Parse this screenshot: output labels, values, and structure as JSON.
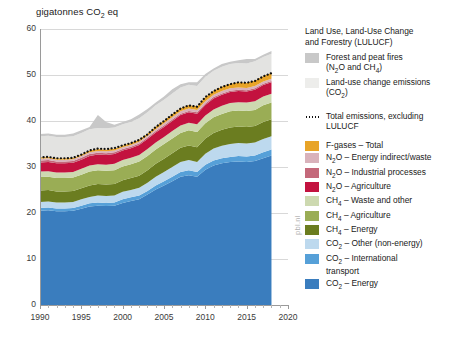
{
  "chart_data": {
    "type": "area",
    "title": "gigatonnes CO2 eq",
    "xlabel": "",
    "ylabel": "gigatonnes CO2 eq",
    "xlim": [
      1990,
      2020
    ],
    "ylim": [
      0,
      60
    ],
    "yticks": [
      0,
      10,
      20,
      30,
      40,
      50,
      60
    ],
    "xticks": [
      1990,
      1995,
      2000,
      2005,
      2010,
      2015,
      2020
    ],
    "grid": true,
    "legend_position": "right",
    "stacked": true,
    "x": [
      1990,
      1991,
      1992,
      1993,
      1994,
      1995,
      1996,
      1997,
      1998,
      1999,
      2000,
      2001,
      2002,
      2003,
      2004,
      2005,
      2006,
      2007,
      2008,
      2009,
      2010,
      2011,
      2012,
      2013,
      2014,
      2015,
      2016,
      2017,
      2018
    ],
    "series": [
      {
        "name": "CO2 - Energy",
        "color": "#3a7dbe",
        "values": [
          20.5,
          20.6,
          20.4,
          20.4,
          20.5,
          20.9,
          21.4,
          21.6,
          21.5,
          21.6,
          22.2,
          22.6,
          23.0,
          24.0,
          25.1,
          26.0,
          26.9,
          27.9,
          28.2,
          27.9,
          29.4,
          30.3,
          30.8,
          31.1,
          31.2,
          31.1,
          31.3,
          31.9,
          32.5
        ]
      },
      {
        "name": "CO2 - International transport",
        "color": "#56a0d8",
        "values": [
          0.6,
          0.6,
          0.6,
          0.6,
          0.6,
          0.7,
          0.7,
          0.7,
          0.7,
          0.7,
          0.8,
          0.8,
          0.8,
          0.8,
          0.9,
          0.9,
          1.0,
          1.0,
          1.1,
          1.0,
          1.1,
          1.1,
          1.1,
          1.1,
          1.2,
          1.2,
          1.2,
          1.3,
          1.3
        ]
      },
      {
        "name": "CO2 - Other (non-energy)",
        "color": "#bdd9ee",
        "values": [
          1.3,
          1.3,
          1.3,
          1.3,
          1.3,
          1.4,
          1.4,
          1.5,
          1.5,
          1.5,
          1.6,
          1.6,
          1.7,
          1.8,
          1.9,
          2.0,
          2.1,
          2.2,
          2.2,
          2.2,
          2.4,
          2.6,
          2.7,
          2.8,
          2.8,
          2.8,
          2.8,
          2.9,
          2.9
        ]
      },
      {
        "name": "CH4 - Energy",
        "color": "#6b7d20",
        "values": [
          2.5,
          2.5,
          2.4,
          2.4,
          2.4,
          2.4,
          2.5,
          2.5,
          2.5,
          2.5,
          2.5,
          2.6,
          2.6,
          2.7,
          2.8,
          2.9,
          3.0,
          3.1,
          3.2,
          3.2,
          3.3,
          3.4,
          3.5,
          3.6,
          3.6,
          3.6,
          3.6,
          3.7,
          3.7
        ]
      },
      {
        "name": "CH4 - Agriculture",
        "color": "#9aad55",
        "values": [
          2.9,
          2.9,
          2.9,
          2.9,
          2.9,
          2.9,
          3.0,
          3.0,
          3.0,
          3.0,
          3.0,
          3.0,
          3.1,
          3.1,
          3.1,
          3.2,
          3.2,
          3.2,
          3.3,
          3.3,
          3.3,
          3.4,
          3.4,
          3.5,
          3.5,
          3.5,
          3.5,
          3.6,
          3.6
        ]
      },
      {
        "name": "CH4 - Waste and other",
        "color": "#cdd9b0",
        "values": [
          1.2,
          1.2,
          1.2,
          1.2,
          1.2,
          1.3,
          1.3,
          1.3,
          1.3,
          1.4,
          1.4,
          1.4,
          1.4,
          1.5,
          1.5,
          1.5,
          1.6,
          1.6,
          1.6,
          1.7,
          1.7,
          1.7,
          1.8,
          1.8,
          1.8,
          1.8,
          1.9,
          1.9,
          1.9
        ]
      },
      {
        "name": "N2O - Agriculture",
        "color": "#c3123f",
        "values": [
          2.0,
          2.0,
          2.0,
          2.0,
          2.0,
          2.0,
          2.1,
          2.1,
          2.1,
          2.1,
          2.1,
          2.1,
          2.2,
          2.2,
          2.2,
          2.2,
          2.2,
          2.3,
          2.3,
          2.3,
          2.3,
          2.4,
          2.4,
          2.4,
          2.4,
          2.4,
          2.5,
          2.5,
          2.5
        ]
      },
      {
        "name": "N2O - Industrial processes",
        "color": "#c4687a",
        "values": [
          0.4,
          0.4,
          0.4,
          0.4,
          0.4,
          0.4,
          0.4,
          0.4,
          0.4,
          0.4,
          0.3,
          0.3,
          0.3,
          0.3,
          0.3,
          0.3,
          0.3,
          0.3,
          0.3,
          0.3,
          0.3,
          0.3,
          0.3,
          0.3,
          0.3,
          0.3,
          0.3,
          0.3,
          0.3
        ]
      },
      {
        "name": "N2O - Energy indirect/waste",
        "color": "#d9b2bb",
        "values": [
          0.4,
          0.4,
          0.4,
          0.4,
          0.4,
          0.4,
          0.4,
          0.4,
          0.4,
          0.4,
          0.4,
          0.4,
          0.4,
          0.4,
          0.4,
          0.5,
          0.5,
          0.5,
          0.5,
          0.5,
          0.5,
          0.5,
          0.5,
          0.5,
          0.5,
          0.5,
          0.5,
          0.5,
          0.5
        ]
      },
      {
        "name": "F-gases - Total",
        "color": "#e8a428",
        "values": [
          0.3,
          0.3,
          0.3,
          0.3,
          0.3,
          0.3,
          0.4,
          0.4,
          0.4,
          0.4,
          0.4,
          0.4,
          0.5,
          0.5,
          0.6,
          0.6,
          0.7,
          0.7,
          0.8,
          0.8,
          0.9,
          0.9,
          1.0,
          1.0,
          1.1,
          1.1,
          1.2,
          1.2,
          1.3
        ]
      },
      {
        "name": "Land-use change emissions (CO2)",
        "color": "#e3e3e1",
        "values": [
          4.6,
          4.6,
          4.6,
          4.6,
          4.7,
          4.7,
          4.6,
          4.6,
          4.6,
          4.6,
          4.6,
          4.6,
          4.6,
          4.6,
          4.6,
          4.5,
          4.5,
          4.5,
          4.4,
          4.4,
          4.4,
          4.3,
          4.3,
          4.3,
          4.2,
          4.2,
          4.2,
          4.1,
          4.1
        ]
      },
      {
        "name": "Forest and peat fires (N2O and CH4)",
        "color": "#c8c8c8",
        "values": [
          0.5,
          0.5,
          0.5,
          0.5,
          0.6,
          0.6,
          0.5,
          2.8,
          1.4,
          0.6,
          0.5,
          0.6,
          0.8,
          0.7,
          0.6,
          0.7,
          0.9,
          0.7,
          0.5,
          0.8,
          0.6,
          0.5,
          0.6,
          0.5,
          0.6,
          1.0,
          0.5,
          0.5,
          0.6
        ]
      }
    ],
    "total_line": {
      "name": "Total emissions, excluding LULUCF",
      "style": "dotted",
      "color": "#111111",
      "values": [
        32.1,
        32.2,
        31.9,
        31.9,
        32.0,
        32.7,
        33.6,
        34.0,
        33.9,
        34.1,
        34.7,
        35.2,
        35.9,
        37.1,
        38.7,
        40.0,
        41.4,
        42.7,
        43.4,
        43.1,
        45.2,
        46.5,
        47.4,
        48.0,
        48.4,
        48.3,
        48.7,
        49.7,
        50.4
      ]
    }
  },
  "legend": {
    "lulucf_heading_line1": "Land Use, Land-Use Change",
    "lulucf_heading_line2": "and Forestry (LULUCF)",
    "entries_lulucf": [
      {
        "label_line1": "Forest and peat fires",
        "label_line2": "(N2O and CH4)",
        "color": "#c8c8c8"
      },
      {
        "label_line1": "Land-use change emissions",
        "label_line2": "(CO2)",
        "color": "#ededeb"
      }
    ],
    "total_label_line1": "Total emissions, excluding",
    "total_label_line2": "LULUCF",
    "entries_main": [
      {
        "label": "F-gases - Total",
        "color": "#e8a428"
      },
      {
        "label": "N2O - Energy indirect/waste",
        "color": "#d9b2bb"
      },
      {
        "label": "N2O - Industrial processes",
        "color": "#c4687a"
      },
      {
        "label": "N2O - Agriculture",
        "color": "#c3123f"
      },
      {
        "label": "CH4 - Waste and other",
        "color": "#cdd9b0"
      },
      {
        "label": "CH4 - Agriculture",
        "color": "#9aad55"
      },
      {
        "label": "CH4 - Energy",
        "color": "#6b7d20"
      },
      {
        "label": "CO2 - Other (non-energy)",
        "color": "#bdd9ee"
      },
      {
        "label": "CO2 - International transport",
        "color": "#56a0d8"
      },
      {
        "label": "CO2 - Energy",
        "color": "#3a7dbe"
      }
    ]
  },
  "watermark": "pbl.nl"
}
